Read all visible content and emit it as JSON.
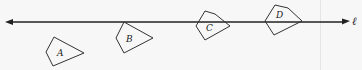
{
  "diagram": {
    "line": {
      "label": "ℓ",
      "color": "#222222",
      "arrow_left": true,
      "arrow_right": true
    },
    "shapes": [
      {
        "label": "A"
      },
      {
        "label": "B"
      },
      {
        "label": "C"
      },
      {
        "label": "D"
      }
    ]
  }
}
